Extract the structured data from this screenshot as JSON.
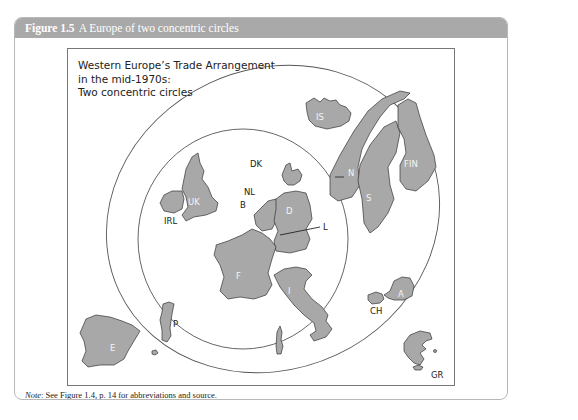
{
  "figure": {
    "number": "Figure 1.5",
    "caption": "A Europe of two concentric circles",
    "header_color": "#a9a9a9"
  },
  "map": {
    "title": "Western Europe’s Trade Arrangement\nin the mid-1970s:\nTwo concentric circles",
    "inner_circle_label": "EC members",
    "outer_circle_label": "EFTA members",
    "country_fill": "#a8a8a8",
    "labels": {
      "IS": "IS",
      "N": "N",
      "S": "S",
      "FIN": "FIN",
      "UK": "UK",
      "IRL": "IRL",
      "DK": "DK",
      "NL": "NL",
      "B": "B",
      "D": "D",
      "L": "L",
      "F": "F",
      "I": "I",
      "P": "P",
      "E": "E",
      "A": "A",
      "CH": "CH",
      "GR": "GR"
    }
  },
  "note": {
    "prefix": "Note",
    "text": ": See Figure 1.4, p. 14 for abbreviations and source."
  }
}
